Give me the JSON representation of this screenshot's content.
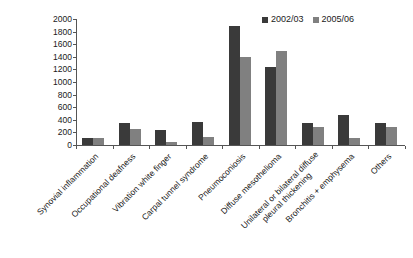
{
  "chart_data": {
    "type": "bar",
    "title": "",
    "subtitle": "",
    "xlabel": "",
    "ylabel": "",
    "ylim": [
      0,
      2000
    ],
    "ytick_step": 200,
    "yticks": [
      0,
      200,
      400,
      600,
      800,
      1000,
      1200,
      1400,
      1600,
      1800,
      2000
    ],
    "grid": false,
    "legend_position": "top-right",
    "categories": [
      "Synovial inflammation",
      "Occupational deafness",
      "Vibration white finger",
      "Carpal tunnel syndrome",
      "Pneumoconiosis",
      "Diffuse mesothelioma",
      "Unilateral or bilateral diffuse pleural thickening",
      "Bronchitis + emphysema",
      "Others"
    ],
    "series": [
      {
        "name": "2002/03",
        "color": "#3a3a3a",
        "values": [
          110,
          355,
          240,
          370,
          1890,
          1240,
          355,
          475,
          355
        ]
      },
      {
        "name": "2005/06",
        "color": "#808080",
        "values": [
          110,
          250,
          55,
          125,
          1390,
          1490,
          285,
          115,
          285
        ]
      }
    ]
  },
  "legend": {
    "entries": [
      {
        "label": "2002/03",
        "color": "#3a3a3a"
      },
      {
        "label": "2005/06",
        "color": "#808080"
      }
    ]
  },
  "axis_labels": {
    "category_lines": [
      [
        "Synovial inflammation"
      ],
      [
        "Occupational deafness"
      ],
      [
        "Vibration white finger"
      ],
      [
        "Carpal tunnel syndrome"
      ],
      [
        "Pneumoconiosis"
      ],
      [
        "Diffuse mesothelioma"
      ],
      [
        "Unilateral or bilateral diffuse",
        "pleural thickening"
      ],
      [
        "Bronchitis + emphysema"
      ],
      [
        "Others"
      ]
    ]
  }
}
